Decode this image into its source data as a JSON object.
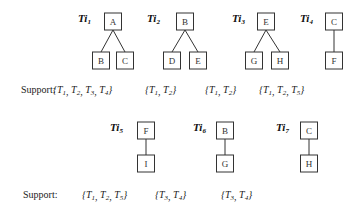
{
  "figure": {
    "support_label": "Support:",
    "rows": [
      {
        "trees": [
          {
            "id": "Ti1",
            "label": "Ti",
            "sub": "1",
            "root": "A",
            "children": [
              "B",
              "C"
            ],
            "support": [
              "1",
              "2",
              "3",
              "4"
            ]
          },
          {
            "id": "Ti2",
            "label": "Ti",
            "sub": "2",
            "root": "B",
            "children": [
              "D",
              "E"
            ],
            "support": [
              "1",
              "2"
            ]
          },
          {
            "id": "Ti3",
            "label": "Ti",
            "sub": "3",
            "root": "E",
            "children": [
              "G",
              "H"
            ],
            "support": [
              "1",
              "2"
            ]
          },
          {
            "id": "Ti4",
            "label": "Ti",
            "sub": "4",
            "root": "C",
            "children": [
              "F"
            ],
            "support": [
              "1",
              "2",
              "5"
            ]
          }
        ]
      },
      {
        "trees": [
          {
            "id": "Ti5",
            "label": "Ti",
            "sub": "5",
            "root": "F",
            "children": [
              "I"
            ],
            "support": [
              "1",
              "2",
              "5"
            ]
          },
          {
            "id": "Ti6",
            "label": "Ti",
            "sub": "6",
            "root": "B",
            "children": [
              "G"
            ],
            "support": [
              "3",
              "4"
            ]
          },
          {
            "id": "Ti7",
            "label": "Ti",
            "sub": "7",
            "root": "C",
            "children": [
              "H"
            ],
            "support": [
              "3",
              "4"
            ]
          }
        ]
      }
    ],
    "transaction_prefix": "T"
  }
}
